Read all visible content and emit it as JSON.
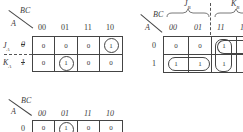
{
  "map1": {
    "corner_col_var": "BC",
    "corner_row_var": "A",
    "columns": [
      "00",
      "01",
      "11",
      "10"
    ],
    "row_labels": [
      {
        "left": "J",
        "left_sub": "A",
        "value": "0",
        "value_crossed": true
      },
      {
        "left": "K",
        "left_sub": "A",
        "value": "1",
        "value_crossed": true
      }
    ],
    "cells": [
      [
        "0",
        "0",
        "0",
        "1"
      ],
      [
        "0",
        "1",
        "0",
        "0"
      ]
    ],
    "circled": [
      [
        0,
        3
      ],
      [
        1,
        1
      ]
    ]
  },
  "map2": {
    "corner_col_var": "BC",
    "corner_row_var": "A",
    "columns": [
      "00",
      "01",
      "11",
      "1"
    ],
    "columns_crossed": [
      true,
      true,
      true,
      true
    ],
    "brace_labels": [
      {
        "label": "J",
        "sub": "B"
      },
      {
        "label": "K",
        "sub": "B"
      }
    ],
    "row_labels": [
      "0",
      "1"
    ],
    "cells": [
      [
        "0",
        "0",
        "1",
        ""
      ],
      [
        "1",
        "1",
        "1",
        ""
      ]
    ],
    "groups": [
      "row1-col00-col01",
      "col11-rows0-1",
      "row0-col11-onwards"
    ]
  },
  "map3": {
    "corner_col_var": "BC",
    "corner_row_var": "A",
    "columns": [
      "00",
      "01",
      "11",
      "10"
    ],
    "columns_crossed": [
      true,
      true,
      true,
      true
    ],
    "row_labels": [
      "0"
    ],
    "cells": [
      [
        "0",
        "1",
        "0",
        "0"
      ]
    ],
    "circled": [
      [
        0,
        1
      ]
    ]
  }
}
